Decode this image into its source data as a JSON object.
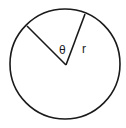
{
  "diagram": {
    "type": "circle-sector",
    "labels": {
      "angle": "θ",
      "radius": "r"
    },
    "colors": {
      "stroke": "#1a1a1a",
      "background": "#ffffff"
    }
  }
}
